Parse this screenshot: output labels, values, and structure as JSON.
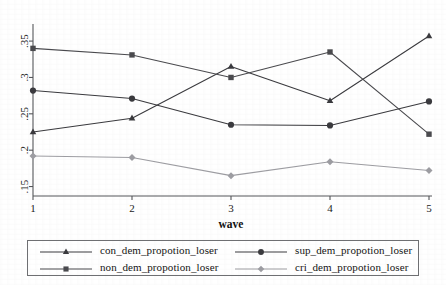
{
  "chart_data": {
    "type": "line",
    "title": "",
    "subtitle": "",
    "xlabel": "wave",
    "ylabel": "",
    "x": [
      1,
      2,
      3,
      4,
      5
    ],
    "xticklabels": [
      "1",
      "2",
      "3",
      "4",
      "5"
    ],
    "yticklabels": [
      ".15",
      ".2",
      ".25",
      ".3",
      ".35"
    ],
    "ytickvalues": [
      0.15,
      0.2,
      0.25,
      0.3,
      0.35
    ],
    "xlim": [
      1,
      5
    ],
    "ylim": [
      0.137,
      0.368
    ],
    "grid": false,
    "legend_position": "bottom",
    "legend_columns": 2,
    "series": [
      {
        "name": "con_dem_propotion_loser",
        "marker": "triangle",
        "color": "#3a3a3e",
        "values": [
          0.225,
          0.244,
          0.315,
          0.268,
          0.357
        ]
      },
      {
        "name": "sup_dem_propotion_loser",
        "marker": "circle",
        "color": "#3a3a3e",
        "values": [
          0.282,
          0.271,
          0.235,
          0.234,
          0.267
        ]
      },
      {
        "name": "non_dem_propotion_loser",
        "marker": "square",
        "color": "#4a4a4e",
        "values": [
          0.34,
          0.331,
          0.3,
          0.335,
          0.222
        ]
      },
      {
        "name": "cri_dem_propotion_loser",
        "marker": "diamond",
        "color": "#9d9da2",
        "values": [
          0.192,
          0.19,
          0.165,
          0.184,
          0.172
        ]
      }
    ]
  },
  "legend": {
    "entries": [
      {
        "label": "con_dem_propotion_loser",
        "marker": "triangle",
        "color": "#3a3a3e"
      },
      {
        "label": "sup_dem_propotion_loser",
        "marker": "circle",
        "color": "#3a3a3e"
      },
      {
        "label": "non_dem_propotion_loser",
        "marker": "square",
        "color": "#4a4a4e"
      },
      {
        "label": "cri_dem_propotion_loser",
        "marker": "diamond",
        "color": "#9d9da2"
      }
    ]
  },
  "axes": {
    "x_title": "wave",
    "x_ticks": [
      "1",
      "2",
      "3",
      "4",
      "5"
    ],
    "y_ticks": [
      ".15",
      ".2",
      ".25",
      ".3",
      ".35"
    ]
  }
}
